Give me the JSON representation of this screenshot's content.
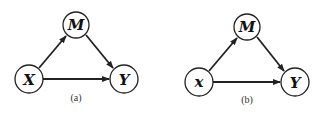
{
  "diagrams": [
    {
      "id": "a",
      "caption": "(a)",
      "nodes": [
        {
          "key": "X",
          "label": "X",
          "cx": 29,
          "cy": 79,
          "r": 14
        },
        {
          "key": "M",
          "label": "M",
          "cx": 76,
          "cy": 25,
          "r": 13
        },
        {
          "key": "Y",
          "label": "Y",
          "cx": 124,
          "cy": 79,
          "r": 14
        }
      ],
      "edges": [
        {
          "from": "X",
          "to": "M"
        },
        {
          "from": "M",
          "to": "Y"
        },
        {
          "from": "X",
          "to": "Y"
        }
      ]
    },
    {
      "id": "b",
      "caption": "(b)",
      "nodes": [
        {
          "key": "x",
          "label": "x",
          "cx": 199,
          "cy": 82,
          "r": 14
        },
        {
          "key": "M",
          "label": "M",
          "cx": 247,
          "cy": 27,
          "r": 13
        },
        {
          "key": "Y",
          "label": "Y",
          "cx": 295,
          "cy": 82,
          "r": 14
        }
      ],
      "edges": [
        {
          "from": "x",
          "to": "M"
        },
        {
          "from": "M",
          "to": "Y"
        },
        {
          "from": "x",
          "to": "Y"
        }
      ]
    }
  ],
  "colors": {
    "stroke": "#222222",
    "text": "#111111",
    "background": "#ffffff"
  }
}
